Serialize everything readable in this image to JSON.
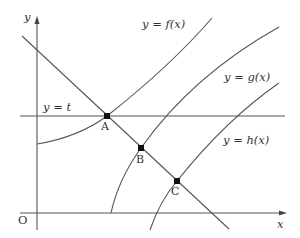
{
  "diagram": {
    "axes": {
      "x_label": "x",
      "y_label": "y",
      "origin_label": "O"
    },
    "labels": {
      "line_t": "y = t",
      "curve_f": "y = f(x)",
      "curve_g": "y = g(x)",
      "curve_h": "y = h(x)"
    },
    "points": {
      "A": "A",
      "B": "B",
      "C": "C"
    },
    "colors": {
      "line": "#444444",
      "point": "#111111",
      "background": "#ffffff"
    }
  }
}
